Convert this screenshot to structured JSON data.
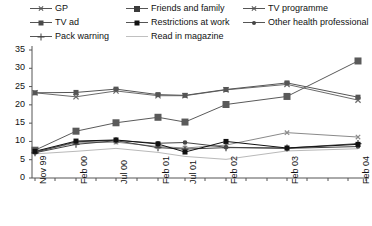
{
  "chart_data": {
    "type": "line",
    "title": "",
    "subtitle": "",
    "xlabel": "",
    "ylabel": "",
    "grid": false,
    "legend_position": "top",
    "ylim": [
      0,
      35
    ],
    "yticks": [
      "0",
      "5",
      "10",
      "15",
      "20",
      "25",
      "30",
      "35"
    ],
    "ytick_values": [
      0,
      5,
      10,
      15,
      20,
      25,
      30,
      35
    ],
    "categories": [
      "Nov 99",
      "Feb 00",
      "Jul 00",
      "Feb 01",
      "Jul 01",
      "Feb 02",
      "Feb 03",
      "Feb 04"
    ],
    "xtick_labels": [
      "Nov 99",
      "Feb 00",
      "Jul 00",
      "Feb 01",
      "Jul 01",
      "Feb 02",
      "Feb 03",
      "Feb 04"
    ],
    "series": [
      {
        "name": "GP",
        "marker": "x",
        "color": "#6b6b6b",
        "values": [
          23.3,
          22.2,
          23.8,
          22.5,
          22.5,
          24.1,
          25.6,
          21.3
        ]
      },
      {
        "name": "Friends and family",
        "marker": "square-large",
        "color": "#5a5a5a",
        "values": [
          7.6,
          12.8,
          15.1,
          16.6,
          15.3,
          20.1,
          22.3,
          32.0
        ]
      },
      {
        "name": "TV programme",
        "marker": "x-small",
        "color": "#8a8a8a",
        "values": [
          7.2,
          9.6,
          9.8,
          8.6,
          8.2,
          9.0,
          12.4,
          11.2
        ]
      },
      {
        "name": "TV ad",
        "marker": "square-medium",
        "color": "#555555",
        "values": [
          23.3,
          23.4,
          24.3,
          22.8,
          22.6,
          24.2,
          26.0,
          22.1
        ]
      },
      {
        "name": "Restrictions at work",
        "marker": "square-black",
        "color": "#111111",
        "values": [
          7.3,
          10.1,
          10.4,
          9.3,
          7.1,
          10.0,
          8.2,
          9.2
        ]
      },
      {
        "name": "Other health professional",
        "marker": "dot",
        "color": "#454545",
        "values": [
          7.0,
          9.9,
          10.3,
          9.5,
          9.7,
          8.4,
          8.1,
          8.6
        ]
      },
      {
        "name": "Pack warning",
        "marker": "plus",
        "color": "#444444",
        "values": [
          6.9,
          9.2,
          10.2,
          8.3,
          7.9,
          8.3,
          8.2,
          9.4
        ]
      },
      {
        "name": "Read  in magazine",
        "marker": "none",
        "color": "#b9b9b9",
        "values": [
          6.6,
          7.3,
          8.1,
          7.0,
          5.9,
          5.1,
          7.4,
          8.0
        ]
      }
    ]
  },
  "legend": {
    "items": [
      {
        "label": "GP",
        "marker": "x",
        "col": 0,
        "row": 0
      },
      {
        "label": "Friends and family",
        "marker": "square-large",
        "col": 1,
        "row": 0
      },
      {
        "label": "TV programme",
        "marker": "x-small",
        "col": 2,
        "row": 0
      },
      {
        "label": "TV ad",
        "marker": "square-medium",
        "col": 0,
        "row": 1
      },
      {
        "label": "Restrictions at work",
        "marker": "square-black",
        "col": 1,
        "row": 1
      },
      {
        "label": "Other health professional",
        "marker": "dot",
        "col": 2,
        "row": 1
      },
      {
        "label": "Pack warning",
        "marker": "plus",
        "col": 0,
        "row": 2
      },
      {
        "label": "Read  in magazine",
        "marker": "none",
        "col": 1,
        "row": 2
      }
    ]
  },
  "axes": {
    "y_axis_color": "#555555",
    "x_axis_color": "#555555"
  }
}
